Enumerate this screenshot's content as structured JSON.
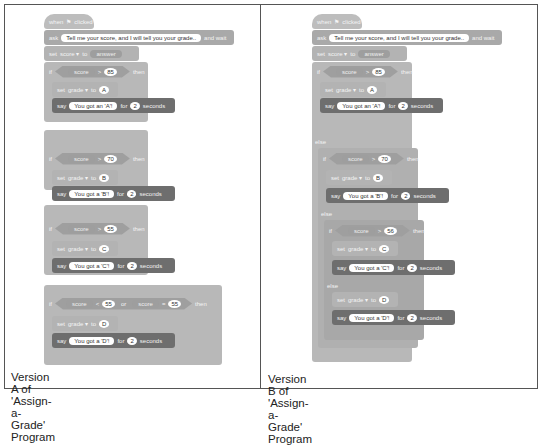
{
  "versionA": {
    "caption": "Version A of 'Assign-a-Grade' Program",
    "when": "when",
    "clicked": "clicked",
    "ask": "ask",
    "ask_text": "Tell me your score, and I will tell you your grade..",
    "and_wait": "and wait",
    "set": "set",
    "score_var": "score ▾",
    "to": "to",
    "answer": "answer",
    "ifs": [
      {
        "if": "if",
        "cond_var": "score",
        "op": ">",
        "val": "85",
        "then": "then",
        "grade": "A",
        "say": "You got an 'A'!"
      },
      {
        "if": "if",
        "cond_var": "score",
        "op": ">",
        "val": "70",
        "then": "then",
        "grade": "B",
        "say": "You got a 'B'!"
      },
      {
        "if": "if",
        "cond_var": "score",
        "op": ">",
        "val": "55",
        "then": "then",
        "grade": "C",
        "say": "You got a 'C'!"
      },
      {
        "if": "if",
        "cond_var": "score",
        "op": "<",
        "val": "55",
        "or": "or",
        "cond_var2": "score",
        "op2": "=",
        "val2": "55",
        "then": "then",
        "grade": "D",
        "say": "You got a 'D'!"
      }
    ],
    "grade_var": "grade ▾",
    "say": "say",
    "for": "for",
    "secs": "2",
    "seconds": "seconds"
  },
  "versionB": {
    "caption": "Version B of 'Assign-a-Grade' Program",
    "when": "when",
    "clicked": "clicked",
    "ask": "ask",
    "ask_text": "Tell me your score, and I will tell you your grade..",
    "and_wait": "and wait",
    "set": "set",
    "score_var": "score ▾",
    "to": "to",
    "answer": "answer",
    "if": "if",
    "else": "else",
    "then": "then",
    "cond_var": "score",
    "op": ">",
    "vals": [
      "85",
      "70",
      "56"
    ],
    "grades": [
      "A",
      "B",
      "C",
      "D"
    ],
    "says": [
      "You got an 'A'!",
      "You got a 'B'!",
      "You got a 'C'!",
      "You got a 'D'!"
    ],
    "grade_var": "grade ▾",
    "say": "say",
    "for": "for",
    "secs": "2",
    "seconds": "seconds"
  }
}
